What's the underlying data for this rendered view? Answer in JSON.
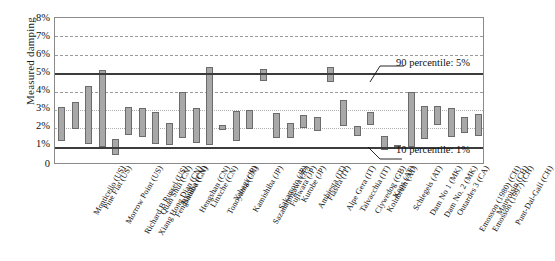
{
  "chart": {
    "type": "bar",
    "title": "",
    "ylabel": "Measured damping",
    "xlabel": ""
  },
  "axis": {
    "yticks": [
      "8%",
      "7%",
      "6%",
      "5%",
      "4%",
      "3%",
      "2%",
      "1%",
      "0"
    ],
    "ymin": 0,
    "ymax": 8
  },
  "annotations": {
    "p90": "90 percentile: 5%",
    "p10": "10 percentile: 1%"
  },
  "chart_data": {
    "type": "bar",
    "title": "",
    "xlabel": "",
    "ylabel": "Measured damping",
    "ylim": [
      0,
      8
    ],
    "yunit": "%",
    "ytick_labels": [
      "0",
      "1%",
      "2%",
      "3%",
      "4%",
      "5%",
      "6%",
      "7%",
      "8%"
    ],
    "grid": true,
    "legend": false,
    "note": "Floating (range) bars: each bar spans a low-to-high measured damping interval per dam.",
    "reference_lines": [
      {
        "label": "90 percentile: 5%",
        "value": 5
      },
      {
        "label": "10 percentile: 1%",
        "value": 1
      }
    ],
    "categories": [
      "Monticello (US)",
      "Pine Flat (US)",
      "Morrow Point (US)",
      "Richard B Russel (US)",
      "Xiang Hong Dian (CN)",
      "Quan Shui (CN)",
      "Fengshuiba (CN)",
      "Baniba (CN)",
      "Hengshan (CN)",
      "Linxche (CN)",
      "Tonoyama (CN)",
      "Yabagi (JP)",
      "Kamishiba (JP)",
      "Sazanamigawa (JP)",
      "Sakamoto (JP)",
      "Fujiwara (JP)",
      "Kurobe (JP)",
      "Ambiesta (IT)",
      "Fiastra (IT)",
      "Alpe Gera (IT)",
      "Talvacchia (IT)",
      "Clywedog (GB)",
      "Kolnbrein (AT)",
      "Kops (AT)",
      "Schlegeis (AT)",
      "Dam No 1 (MK)",
      "Dam No. 2 (MK)",
      "Outardes 3 (CA)",
      "Emosson (1980) (CH)",
      "Emosson (1997) (CH)",
      "Mauvoisin (CH)",
      "Punt-Dal-Gall (CH)"
    ],
    "series": [
      {
        "name": "Measured damping range (low)",
        "values": [
          1.3,
          1.95,
          1.15,
          1.0,
          0.55,
          1.65,
          1.5,
          1.15,
          1.1,
          1.45,
          1.2,
          1.1,
          1.9,
          1.3,
          1.95,
          4.55,
          1.45,
          1.45,
          2.0,
          1.85,
          4.5,
          2.1,
          1.6,
          2.2,
          0.8,
          1.15,
          1.0,
          1.4,
          2.2,
          1.55,
          1.75,
          1.6
        ]
      },
      {
        "name": "Measured damping range (high)",
        "values": [
          3.15,
          3.45,
          4.3,
          5.15,
          1.4,
          3.15,
          3.1,
          2.9,
          2.3,
          4.0,
          3.1,
          5.35,
          2.2,
          2.95,
          3.0,
          5.25,
          2.85,
          2.3,
          2.7,
          2.6,
          5.35,
          3.55,
          2.1,
          2.9,
          1.6,
          1.1,
          3.95,
          3.2,
          3.2,
          3.1,
          2.6,
          2.75
        ]
      }
    ]
  }
}
